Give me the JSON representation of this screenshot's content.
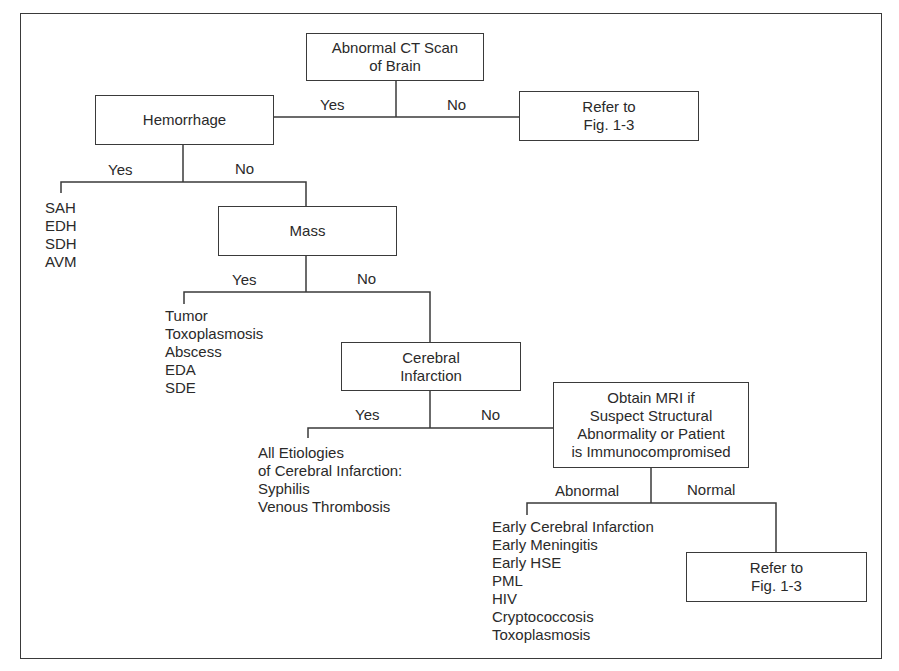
{
  "diagram": {
    "type": "flowchart",
    "nodes": {
      "root": "Abnormal CT Scan\nof Brain",
      "hemorrhage": "Hemorrhage",
      "refer1": "Refer to\nFig. 1-3",
      "mass": "Mass",
      "infarction": "Cerebral\nInfarction",
      "mri": "Obtain MRI if\nSuspect Structural\nAbnormality or Patient\nis Immunocompromised",
      "refer2": "Refer to\nFig. 1-3"
    },
    "edge_labels": {
      "root_yes": "Yes",
      "root_no": "No",
      "hem_yes": "Yes",
      "hem_no": "No",
      "mass_yes": "Yes",
      "mass_no": "No",
      "inf_yes": "Yes",
      "inf_no": "No",
      "mri_abnormal": "Abnormal",
      "mri_normal": "Normal"
    },
    "lists": {
      "hemorrhage_yes": "SAH\nEDH\nSDH\nAVM",
      "mass_yes": "Tumor\nToxoplasmosis\nAbscess\nEDA\nSDE",
      "infarction_yes": "All Etiologies\nof Cerebral Infarction:\nSyphilis\nVenous Thrombosis",
      "mri_abnormal": "Early Cerebral Infarction\nEarly Meningitis\nEarly HSE\nPML\nHIV\nCryptococcosis\nToxoplasmosis"
    }
  }
}
